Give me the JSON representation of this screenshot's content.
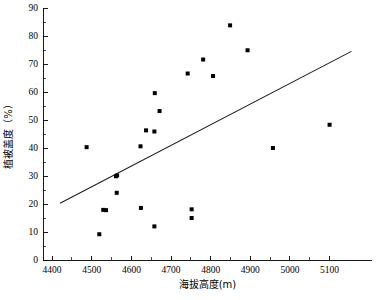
{
  "chart_data": {
    "type": "scatter",
    "title": "",
    "xlabel": "海拔高度(m)",
    "ylabel": "植被盖度（%）",
    "xlim": [
      4400,
      5150
    ],
    "ylim": [
      0,
      90
    ],
    "xticks": [
      4400,
      4500,
      4600,
      4700,
      4800,
      4900,
      5000,
      5100
    ],
    "xtick_labels": [
      "4400",
      "4500",
      "4600",
      "4700",
      "4800",
      "4900",
      "5000",
      "5100"
    ],
    "yticks": [
      0,
      10,
      20,
      30,
      40,
      50,
      60,
      70,
      80,
      90
    ],
    "ytick_labels": [
      "0",
      "10",
      "20",
      "30",
      "40",
      "50",
      "60",
      "70",
      "80",
      "90"
    ],
    "x_minor_tick_step": 50,
    "y_minor_tick_step": 5,
    "grid": false,
    "legend": null,
    "marker": "square",
    "marker_size": 4,
    "marker_color": "#000000",
    "points": [
      {
        "x": 4487,
        "y": 40.3
      },
      {
        "x": 4519,
        "y": 9.2
      },
      {
        "x": 4529,
        "y": 17.9
      },
      {
        "x": 4536,
        "y": 17.8
      },
      {
        "x": 4561,
        "y": 29.9
      },
      {
        "x": 4564,
        "y": 30.2
      },
      {
        "x": 4563,
        "y": 24.0
      },
      {
        "x": 4623,
        "y": 40.6
      },
      {
        "x": 4624,
        "y": 18.6
      },
      {
        "x": 4637,
        "y": 46.3
      },
      {
        "x": 4658,
        "y": 45.9
      },
      {
        "x": 4659,
        "y": 59.6
      },
      {
        "x": 4658,
        "y": 12.0
      },
      {
        "x": 4671,
        "y": 53.2
      },
      {
        "x": 4742,
        "y": 66.6
      },
      {
        "x": 4752,
        "y": 18.1
      },
      {
        "x": 4752,
        "y": 15.0
      },
      {
        "x": 4781,
        "y": 71.6
      },
      {
        "x": 4806,
        "y": 65.7
      },
      {
        "x": 4849,
        "y": 83.8
      },
      {
        "x": 4893,
        "y": 74.9
      },
      {
        "x": 4957,
        "y": 40.0
      },
      {
        "x": 5100,
        "y": 48.3
      }
    ],
    "trend_line": {
      "type": "linear-fit",
      "x_start": 4420,
      "y_start": 20.3,
      "x_end": 5155,
      "y_end": 74.5,
      "color": "#1a1a1a"
    }
  }
}
